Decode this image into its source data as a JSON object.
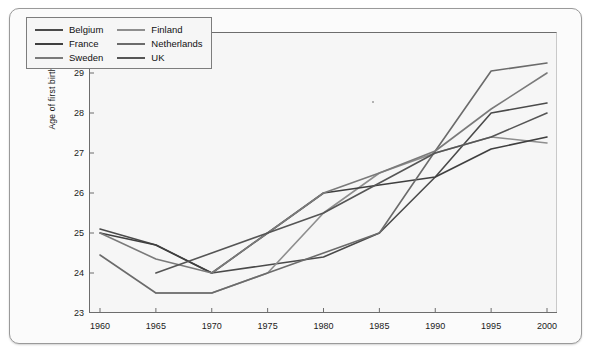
{
  "chart_data": {
    "type": "line",
    "title": "",
    "subtitle": "",
    "xlabel": "",
    "ylabel": "Age of first birth",
    "x": [
      1960,
      1965,
      1970,
      1975,
      1980,
      1985,
      1990,
      1995,
      2000
    ],
    "xticklabels": [
      "1960",
      "1965",
      "1970",
      "1975",
      "1980",
      "1985",
      "1990",
      "1995",
      "2000"
    ],
    "yticklabels": [
      "23",
      "24",
      "25",
      "26",
      "27",
      "28",
      "29",
      "30"
    ],
    "xlim": [
      1958,
      2002
    ],
    "ylim": [
      23,
      30
    ],
    "grid": false,
    "legend_position": "top-left",
    "series": [
      {
        "name": "Belgium",
        "color": "#4a4a4a",
        "x": [
          1960,
          1965,
          1970,
          1975,
          1980,
          1985,
          1990,
          1995,
          2000
        ],
        "values": [
          25.1,
          24.7,
          24.0,
          24.2,
          24.4,
          25.0,
          26.4,
          28.0,
          28.25
        ]
      },
      {
        "name": "Finland",
        "color": "#8e8e8e",
        "x": [
          1965,
          1970,
          1975,
          1980,
          1985,
          1990,
          1995,
          2000
        ],
        "values": [
          23.5,
          23.5,
          24.0,
          25.5,
          26.5,
          27.0,
          27.4,
          27.25
        ]
      },
      {
        "name": "France",
        "color": "#3f3f3f",
        "x": [
          1960,
          1965,
          1970,
          1975,
          1980,
          1985,
          1990,
          1995,
          2000
        ],
        "values": [
          25.0,
          24.7,
          24.0,
          25.0,
          26.0,
          26.2,
          26.4,
          27.1,
          27.4
        ]
      },
      {
        "name": "Netherlands",
        "color": "#6b6b6b",
        "x": [
          1960,
          1965,
          1970,
          1975,
          1980,
          1985,
          1990,
          1995,
          2000
        ],
        "values": [
          24.45,
          23.5,
          23.5,
          24.0,
          24.5,
          25.0,
          27.05,
          29.05,
          29.25
        ]
      },
      {
        "name": "Sweden",
        "color": "#7a7a7a",
        "x": [
          1960,
          1965,
          1970,
          1975,
          1980,
          1985,
          1990,
          1995,
          2000
        ],
        "values": [
          25.0,
          24.35,
          24.0,
          25.0,
          26.0,
          26.5,
          27.05,
          28.1,
          29.0
        ]
      },
      {
        "name": "UK",
        "color": "#555555",
        "x": [
          1965,
          1970,
          1975,
          1980,
          1985,
          1990,
          1995,
          2000
        ],
        "values": [
          24.0,
          24.5,
          25.0,
          25.5,
          26.25,
          27.0,
          27.4,
          28.0
        ]
      }
    ]
  },
  "legend": {
    "items": [
      {
        "label": "Belgium"
      },
      {
        "label": "Finland"
      },
      {
        "label": "France"
      },
      {
        "label": "Netherlands"
      },
      {
        "label": "Sweden"
      },
      {
        "label": "UK"
      }
    ]
  },
  "axes": {
    "y_title": "Age of first birth"
  }
}
